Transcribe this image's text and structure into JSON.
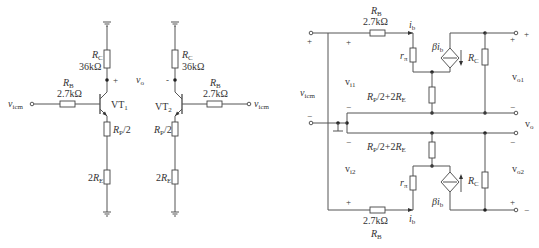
{
  "figure": {
    "left_circuit": {
      "name": "common-mode half-circuit (schematic)",
      "transistor_1": "VT",
      "transistor_1_sub": "1",
      "transistor_2": "VT",
      "transistor_2_sub": "2",
      "rc_label": "R",
      "rc_sub": "C",
      "rc_value": "36kΩ",
      "rb_label": "R",
      "rb_sub": "B",
      "rb_value": "2.7kΩ",
      "rp_label": "R",
      "rp_sub": "P",
      "rp_suffix": "/2",
      "re_prefix": "2",
      "re_label": "R",
      "re_sub": "E",
      "input_label": "v",
      "input_sub": "icm",
      "output_label": "v",
      "output_sub": "o",
      "plus": "+",
      "minus": "-"
    },
    "right_circuit": {
      "name": "common-mode small-signal equivalent circuit",
      "rb_label": "R",
      "rb_sub": "B",
      "rb_value": "2.7kΩ",
      "ib_label": "i",
      "ib_sub": "b",
      "rpi_label": "r",
      "rpi_sub": "π",
      "source_label_beta": "βi",
      "source_label_sub": "b",
      "rc_label": "R",
      "rc_sub": "C",
      "emitter_label_a": "R",
      "emitter_label_a_sub": "P",
      "emitter_label_mid": "/2+2",
      "emitter_label_b": "R",
      "emitter_label_b_sub": "E",
      "vicm_label": "v",
      "vicm_sub": "icm",
      "vi1_label": "v",
      "vi1_sub": "i1",
      "vi2_label": "v",
      "vi2_sub": "i2",
      "vo1_label": "v",
      "vo1_sub": "o1",
      "vo2_label": "v",
      "vo2_sub": "o2",
      "vo_label": "v",
      "vo_sub": "o",
      "plus": "+",
      "minus": "−"
    }
  }
}
